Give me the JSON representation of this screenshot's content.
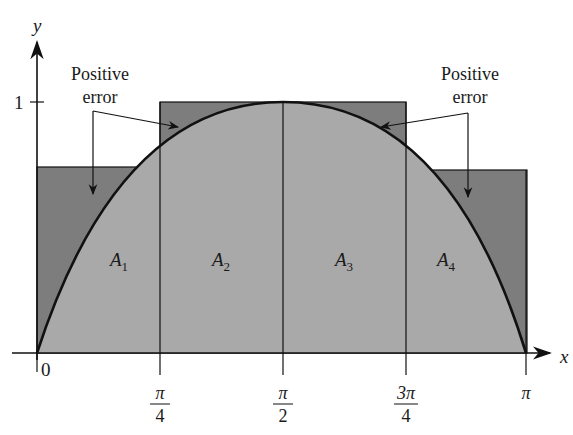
{
  "figure": {
    "type": "midpoint-rule / Riemann sum illustration of y = sin x on [0, pi] with 4 subintervals",
    "colors": {
      "background": "#ffffff",
      "rect_fill": "#7d7d7d",
      "under_curve_fill": "#a9a9a9",
      "stroke": "#111111"
    }
  },
  "axes": {
    "x_label": "x",
    "y_label": "y",
    "origin_label": "0",
    "y_tick_label": "1",
    "x_ticks": [
      {
        "num": "π",
        "den": "4",
        "value": 0.7854
      },
      {
        "num": "π",
        "den": "2",
        "value": 1.5708
      },
      {
        "num": "3π",
        "den": "4",
        "value": 2.3562
      },
      {
        "num": "π",
        "den": "",
        "value": 3.1416
      }
    ]
  },
  "regions": [
    {
      "label": "A",
      "sub": "1"
    },
    {
      "label": "A",
      "sub": "2"
    },
    {
      "label": "A",
      "sub": "3"
    },
    {
      "label": "A",
      "sub": "4"
    }
  ],
  "annotations": {
    "left": {
      "line1": "Positive",
      "line2": "error"
    },
    "right": {
      "line1": "Positive",
      "line2": "error"
    }
  },
  "rectangles": [
    {
      "x_start": 0,
      "x_end": 0.7854,
      "height": 0.7071
    },
    {
      "x_start": 0.7854,
      "x_end": 1.5708,
      "height": 1.0
    },
    {
      "x_start": 1.5708,
      "x_end": 2.3562,
      "height": 1.0
    },
    {
      "x_start": 2.3562,
      "x_end": 3.1416,
      "height": 0.7071
    }
  ]
}
